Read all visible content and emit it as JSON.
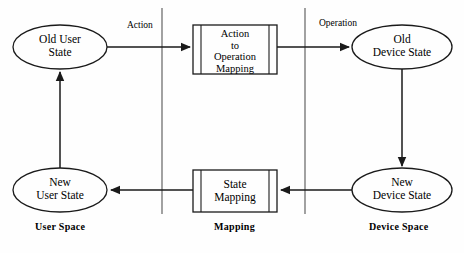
{
  "diagram": {
    "stroke_color": "#1a1a1a",
    "background_color": "#fefefe",
    "nodes": [
      {
        "id": "old-user-state",
        "shape": "ellipse",
        "label": "Old User\nState",
        "cx": 60,
        "cy": 47,
        "rx": 47,
        "ry": 22
      },
      {
        "id": "action-to-operation-mapping",
        "shape": "process-box",
        "label": "Action\nto\nOperation\nMapping",
        "x": 193,
        "y": 25,
        "w": 84,
        "h": 49
      },
      {
        "id": "old-device-state",
        "shape": "ellipse",
        "label": "Old\nDevice State",
        "cx": 402,
        "cy": 47,
        "rx": 50,
        "ry": 22
      },
      {
        "id": "new-user-state",
        "shape": "ellipse",
        "label": "New\nUser State",
        "cx": 60,
        "cy": 190,
        "rx": 47,
        "ry": 22
      },
      {
        "id": "state-mapping",
        "shape": "process-box",
        "label": "State\nMapping",
        "x": 193,
        "y": 170,
        "w": 84,
        "h": 42
      },
      {
        "id": "new-device-state",
        "shape": "ellipse",
        "label": "New\nDevice State",
        "cx": 402,
        "cy": 190,
        "rx": 50,
        "ry": 22
      }
    ],
    "edges": [
      {
        "id": "edge-action",
        "from": "old-user-state",
        "to": "action-to-operation-mapping",
        "label": "Action",
        "direction": "right"
      },
      {
        "id": "edge-operation",
        "from": "action-to-operation-mapping",
        "to": "old-device-state",
        "label": "Operation",
        "direction": "right"
      },
      {
        "id": "edge-device-down",
        "from": "old-device-state",
        "to": "new-device-state",
        "label": "",
        "direction": "down"
      },
      {
        "id": "edge-device-to-state-mapping",
        "from": "new-device-state",
        "to": "state-mapping",
        "label": "",
        "direction": "left"
      },
      {
        "id": "edge-state-mapping-to-user",
        "from": "state-mapping",
        "to": "new-user-state",
        "label": "",
        "direction": "left"
      },
      {
        "id": "edge-user-up",
        "from": "new-user-state",
        "to": "old-user-state",
        "label": "",
        "direction": "up"
      }
    ],
    "edge_labels": {
      "action": "Action",
      "operation": "Operation"
    },
    "spaces": [
      {
        "id": "user-space",
        "label": "User Space",
        "x": 35,
        "y": 221
      },
      {
        "id": "mapping",
        "label": "Mapping",
        "x": 214,
        "y": 221
      },
      {
        "id": "device-space",
        "label": "Device Space",
        "x": 369,
        "y": 221
      }
    ],
    "dividers": [
      {
        "id": "divider-left",
        "x": 162,
        "y1": 8,
        "y2": 214
      },
      {
        "id": "divider-right",
        "x": 305,
        "y1": 8,
        "y2": 214
      }
    ]
  }
}
